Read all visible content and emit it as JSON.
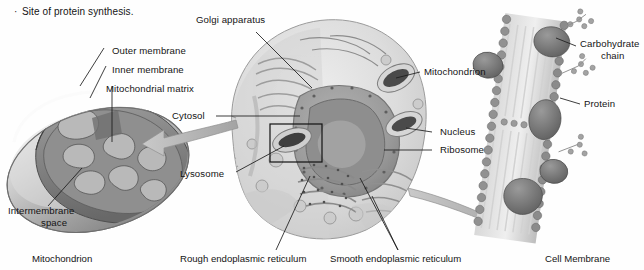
{
  "figure": {
    "kind": "biology-cell-diagram",
    "bullet_note": "Site of protein synthesis.",
    "palette": {
      "background": "#fefefe",
      "ink": "#141414",
      "cell_fill": "#e2e2e2",
      "cell_mid": "#cfcfcf",
      "cell_dark": "#a8a8a8",
      "nucleus": "#9d9d9d",
      "organelle_dark": "#6d6d6d",
      "arrow": "#b4b4b4",
      "membrane_head": "#8e8e8e",
      "protein": "#777777"
    }
  },
  "panels": {
    "mitochondrion": {
      "caption": "Mitochondrion",
      "labels": [
        {
          "id": "outer-membrane",
          "text": "Outer membrane"
        },
        {
          "id": "inner-membrane",
          "text": "Inner membrane"
        },
        {
          "id": "mitochondrial-matrix",
          "text": "Mitochondrial matrix"
        },
        {
          "id": "intermembrane-space-line1",
          "text": "Intermembrane"
        },
        {
          "id": "intermembrane-space-line2",
          "text": "space"
        }
      ]
    },
    "cell": {
      "captions": [
        {
          "id": "rough-er",
          "text": "Rough endoplasmic reticulum"
        },
        {
          "id": "smooth-er",
          "text": "Smooth endoplasmic reticulum"
        }
      ],
      "labels": [
        {
          "id": "golgi-apparatus",
          "text": "Golgi apparatus"
        },
        {
          "id": "cytosol",
          "text": "Cytosol"
        },
        {
          "id": "lysosome",
          "text": "Lysosome"
        },
        {
          "id": "mitochondrion",
          "text": "Mitochondrion"
        },
        {
          "id": "nucleus",
          "text": "Nucleus"
        },
        {
          "id": "ribosome",
          "text": "Ribosome"
        }
      ]
    },
    "membrane": {
      "caption": "Cell Membrane",
      "labels": [
        {
          "id": "carbohydrate-chain-line1",
          "text": "Carbohydrate"
        },
        {
          "id": "carbohydrate-chain-line2",
          "text": "chain"
        },
        {
          "id": "protein",
          "text": "Protein"
        }
      ]
    }
  }
}
